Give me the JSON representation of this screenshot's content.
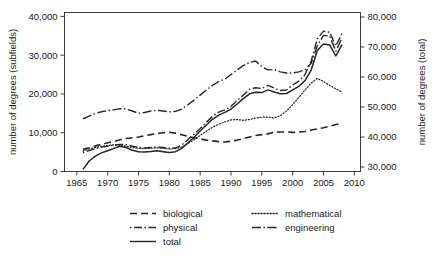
{
  "figure": {
    "caption": ""
  },
  "chart_data": {
    "type": "line",
    "title": "",
    "xlabel": "",
    "ylabel": "number of degrees (subfields)",
    "y2label": "number of degrees (total)",
    "xlim": [
      1963,
      2011
    ],
    "ylim": [
      0,
      41000
    ],
    "y2lim": [
      28500,
      81500
    ],
    "grid": false,
    "legend_position": "below",
    "xticks": [
      1965,
      1970,
      1975,
      1980,
      1985,
      1990,
      1995,
      2000,
      2005,
      2010
    ],
    "xtick_labels": [
      "1965",
      "1970",
      "1975",
      "1980",
      "1985",
      "1990",
      "1995",
      "2000",
      "2005",
      "2010"
    ],
    "yticks": [
      0,
      10000,
      20000,
      30000,
      40000
    ],
    "ytick_labels": [
      "0",
      "10,000",
      "20,000",
      "30,000",
      "40,000"
    ],
    "y2ticks": [
      30000,
      40000,
      50000,
      60000,
      70000,
      80000
    ],
    "y2tick_labels": [
      "30,000",
      "40,000",
      "50,000",
      "60,000",
      "70,000",
      "80,000"
    ],
    "x": [
      1966,
      1967,
      1968,
      1969,
      1970,
      1971,
      1972,
      1973,
      1974,
      1975,
      1976,
      1977,
      1978,
      1979,
      1980,
      1981,
      1982,
      1983,
      1984,
      1985,
      1986,
      1987,
      1988,
      1989,
      1990,
      1991,
      1992,
      1993,
      1994,
      1995,
      1996,
      1997,
      1998,
      1999,
      2000,
      2001,
      2002,
      2003,
      2004,
      2005,
      2006,
      2007,
      2008
    ],
    "series": [
      {
        "name": "biological",
        "axis": "left",
        "style": "dashed",
        "values": [
          5700,
          6100,
          6600,
          7000,
          7400,
          7700,
          8200,
          8500,
          8700,
          8900,
          9200,
          9500,
          9800,
          10000,
          10100,
          9900,
          9500,
          9100,
          8700,
          8400,
          8100,
          7900,
          7700,
          7600,
          7800,
          8100,
          8500,
          8900,
          9300,
          9500,
          9700,
          10100,
          10200,
          10200,
          10100,
          10200,
          10300,
          10700,
          11000,
          11300,
          11700,
          12100,
          12400
        ]
      },
      {
        "name": "physical",
        "axis": "left",
        "style": "dash-dot",
        "values": [
          4900,
          5400,
          5900,
          6300,
          6500,
          6800,
          7000,
          6900,
          6500,
          6200,
          6100,
          6200,
          6300,
          6200,
          6000,
          6100,
          6800,
          8200,
          9600,
          11100,
          12700,
          14200,
          15300,
          15900,
          16800,
          18300,
          19700,
          21200,
          21600,
          21400,
          22200,
          21500,
          20900,
          21000,
          22300,
          23300,
          25000,
          28500,
          34200,
          36200,
          35900,
          32400,
          35600
        ]
      },
      {
        "name": "total",
        "axis": "right",
        "style": "solid",
        "values": [
          29200,
          32000,
          33600,
          34700,
          35400,
          36200,
          36900,
          36500,
          35600,
          35100,
          35000,
          35200,
          35400,
          35100,
          34800,
          35100,
          36200,
          38000,
          39900,
          42000,
          44000,
          45900,
          47300,
          48200,
          49300,
          51000,
          52800,
          54400,
          54900,
          54800,
          55700,
          55000,
          54400,
          54500,
          55700,
          56900,
          58800,
          62300,
          68800,
          71000,
          70700,
          67000,
          70800
        ]
      },
      {
        "name": "mathematical",
        "axis": "left",
        "style": "dotted",
        "values": [
          5300,
          5800,
          6200,
          6500,
          6700,
          6900,
          6800,
          6500,
          6200,
          6000,
          5900,
          6000,
          6100,
          6000,
          5800,
          5900,
          6300,
          7200,
          8200,
          9300,
          10400,
          11400,
          12200,
          12800,
          13300,
          13400,
          13200,
          13400,
          13800,
          14000,
          14000,
          13800,
          14400,
          15600,
          17300,
          19100,
          21000,
          22800,
          24000,
          23200,
          22200,
          21300,
          20500
        ]
      },
      {
        "name": "engineering",
        "axis": "left",
        "style": "dash-dot-dash",
        "values": [
          13600,
          14300,
          15000,
          15400,
          15700,
          15900,
          16200,
          16100,
          15600,
          15000,
          15200,
          15600,
          15800,
          15600,
          15400,
          15500,
          16100,
          17200,
          18400,
          19700,
          21000,
          22200,
          23200,
          23800,
          25000,
          26200,
          27300,
          28100,
          28500,
          27000,
          26200,
          26300,
          25700,
          25400,
          25400,
          25700,
          26200,
          27900,
          32400,
          35100,
          34900,
          31000,
          34500
        ]
      }
    ],
    "legend": [
      {
        "label": "biological",
        "style": "dashed",
        "column": 1,
        "row": 1
      },
      {
        "label": "mathematical",
        "style": "dotted",
        "column": 2,
        "row": 1
      },
      {
        "label": "physical",
        "style": "dash-dot",
        "column": 1,
        "row": 2
      },
      {
        "label": "engineering",
        "style": "dash-dot-dash",
        "column": 2,
        "row": 2
      },
      {
        "label": "total",
        "style": "solid",
        "column": 1,
        "row": 3
      }
    ]
  }
}
